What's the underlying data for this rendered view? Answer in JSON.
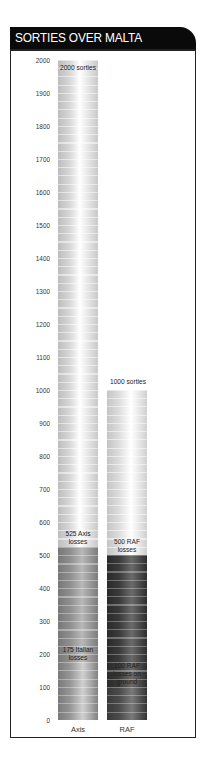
{
  "header": {
    "title": "SORTIES OVER MALTA"
  },
  "y_axis": {
    "ticks": [
      "2000",
      "1900",
      "1800",
      "1700",
      "1600",
      "1500",
      "1400",
      "1300",
      "1200",
      "1100",
      "1000",
      "900",
      "800",
      "700",
      "600",
      "500",
      "400",
      "300",
      "200",
      "100",
      "0"
    ]
  },
  "bars": {
    "axis": {
      "label": "Axis",
      "top_label": "2000 sorties",
      "losses_label_1": "525 Axis",
      "losses_label_2": "losses",
      "italian_label_1": "175 Italian",
      "italian_label_2": "losses"
    },
    "raf": {
      "label": "RAF",
      "top_label": "1000 sorties",
      "losses_label_1": "500 RAF",
      "losses_label_2": "losses",
      "ground_label_1": "100 RAF",
      "ground_label_2": "losses on",
      "ground_label_3": "ground"
    }
  },
  "colors": {
    "header_bg": "#0a0a0a",
    "sorties_fill": "#e4e4e4",
    "axis_losses_fill": "#8f8f8f",
    "raf_losses_fill": "#3a3a3a"
  },
  "chart_data": {
    "type": "bar",
    "title": "SORTIES OVER MALTA",
    "categories": [
      "Axis",
      "RAF"
    ],
    "series": [
      {
        "name": "Sorties",
        "values": [
          2000,
          1000
        ]
      },
      {
        "name": "Losses",
        "values": [
          525,
          500
        ]
      },
      {
        "name": "Sub-losses (Italian / RAF on ground)",
        "values": [
          175,
          100
        ]
      }
    ],
    "annotations": [
      "2000 sorties",
      "1000 sorties",
      "525 Axis losses",
      "500 RAF losses",
      "175 Italian losses",
      "100 RAF losses on ground"
    ],
    "xlabel": "",
    "ylabel": "",
    "ylim": [
      0,
      2000
    ],
    "yticks": [
      0,
      100,
      200,
      300,
      400,
      500,
      600,
      700,
      800,
      900,
      1000,
      1100,
      1200,
      1300,
      1400,
      1500,
      1600,
      1700,
      1800,
      1900,
      2000
    ],
    "grid": false,
    "legend": null
  }
}
